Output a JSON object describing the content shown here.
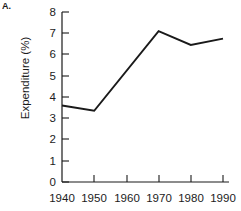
{
  "panel": {
    "label": "A."
  },
  "chart_data": {
    "type": "line",
    "title": "",
    "xlabel": "",
    "ylabel": "Expenditure (%)",
    "x": [
      1940,
      1950,
      1970,
      1980,
      1990
    ],
    "values": [
      3.6,
      3.35,
      7.1,
      6.45,
      6.75
    ],
    "series": [
      {
        "name": "Expenditure",
        "x": [
          1940,
          1950,
          1970,
          1980,
          1990
        ],
        "values": [
          3.6,
          3.35,
          7.1,
          6.45,
          6.75
        ]
      }
    ],
    "xlim": [
      1940,
      1990
    ],
    "ylim": [
      0,
      8
    ],
    "xticks": [
      1940,
      1950,
      1960,
      1970,
      1980,
      1990
    ],
    "yticks": [
      0,
      1,
      2,
      3,
      4,
      5,
      6,
      7,
      8
    ],
    "xticklabels": [
      "1940",
      "1950",
      "1960",
      "1970",
      "1980",
      "1990"
    ],
    "yticklabels": [
      "0",
      "1",
      "2",
      "3",
      "4",
      "5",
      "6",
      "7",
      "8"
    ],
    "grid": false,
    "legend": null,
    "line_color": "#1a1a1a",
    "axis_color": "#1a1a1a"
  }
}
